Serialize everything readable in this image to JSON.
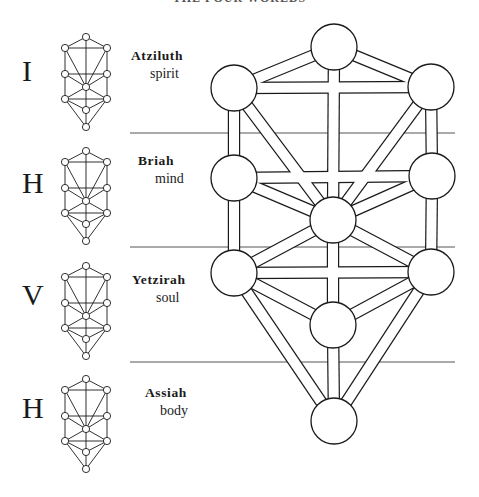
{
  "title": "THE FOUR WORLDS",
  "worlds": [
    {
      "letter": "I",
      "name": "Atziluth",
      "meaning": "spirit",
      "top": 35
    },
    {
      "letter": "H",
      "name": "Briah",
      "meaning": "mind",
      "top": 150
    },
    {
      "letter": "V",
      "name": "Yetzirah",
      "meaning": "soul",
      "top": 264
    },
    {
      "letter": "H",
      "name": "Assiah",
      "meaning": "body",
      "top": 378
    }
  ],
  "colors": {
    "line": "#1a1a1a",
    "separator": "#555555",
    "fill": "#ffffff"
  },
  "separators_y": [
    133,
    247,
    362
  ],
  "tree": {
    "radius": 23,
    "path_half_width": 5,
    "nodes": {
      "kether": [
        334,
        47
      ],
      "binah": [
        234,
        88
      ],
      "chokmah": [
        431,
        87
      ],
      "geburah": [
        234,
        178
      ],
      "chesed": [
        432,
        176
      ],
      "tiphareth": [
        333,
        220
      ],
      "hod": [
        234,
        273
      ],
      "netzach": [
        431,
        272
      ],
      "yesod": [
        333,
        325
      ],
      "malkuth": [
        334,
        421
      ]
    },
    "paths": [
      [
        "kether",
        "binah"
      ],
      [
        "kether",
        "chokmah"
      ],
      [
        "kether",
        "tiphareth"
      ],
      [
        "binah",
        "chokmah"
      ],
      [
        "binah",
        "geburah"
      ],
      [
        "binah",
        "tiphareth"
      ],
      [
        "chokmah",
        "chesed"
      ],
      [
        "chokmah",
        "tiphareth"
      ],
      [
        "geburah",
        "chesed"
      ],
      [
        "geburah",
        "tiphareth"
      ],
      [
        "geburah",
        "hod"
      ],
      [
        "chesed",
        "tiphareth"
      ],
      [
        "chesed",
        "netzach"
      ],
      [
        "tiphareth",
        "hod"
      ],
      [
        "tiphareth",
        "netzach"
      ],
      [
        "tiphareth",
        "yesod"
      ],
      [
        "hod",
        "netzach"
      ],
      [
        "hod",
        "yesod"
      ],
      [
        "hod",
        "malkuth"
      ],
      [
        "netzach",
        "yesod"
      ],
      [
        "netzach",
        "malkuth"
      ],
      [
        "yesod",
        "malkuth"
      ]
    ]
  },
  "mini_tree": {
    "radius": 3.6,
    "nodes": {
      "kether": [
        0,
        -50
      ],
      "binah": [
        -21,
        -39
      ],
      "chokmah": [
        21,
        -39
      ],
      "geburah": [
        -21,
        -13
      ],
      "chesed": [
        21,
        -13
      ],
      "tiphareth": [
        0,
        0
      ],
      "hod": [
        -21,
        12
      ],
      "netzach": [
        21,
        12
      ],
      "yesod": [
        0,
        23
      ],
      "malkuth": [
        0,
        40
      ]
    },
    "centers": [
      [
        86,
        87
      ],
      [
        86,
        201
      ],
      [
        86,
        316
      ],
      [
        86,
        429
      ]
    ]
  }
}
